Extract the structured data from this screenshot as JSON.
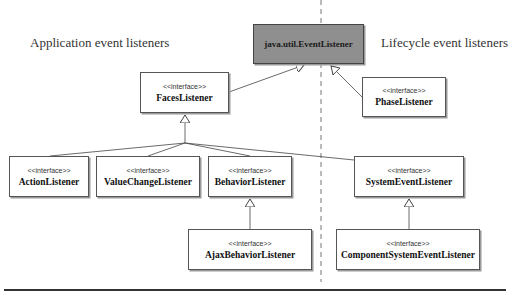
{
  "regions": {
    "left_label": "Application event listeners",
    "right_label": "Lifecycle event listeners"
  },
  "nodes": {
    "event_listener": {
      "name": "java.util.EventListener",
      "stereotype": ""
    },
    "faces_listener": {
      "name": "FacesListener",
      "stereotype": "<<interface>>"
    },
    "phase_listener": {
      "name": "PhaseListener",
      "stereotype": "<<interface>>"
    },
    "action_listener": {
      "name": "ActionListener",
      "stereotype": "<<interface>>"
    },
    "value_change_listener": {
      "name": "ValueChangeListener",
      "stereotype": "<<interface>>"
    },
    "behavior_listener": {
      "name": "BehaviorListener",
      "stereotype": "<<interface>>"
    },
    "system_event_listener": {
      "name": "SystemEventListener",
      "stereotype": "<<interface>>"
    },
    "ajax_behavior_listener": {
      "name": "AjaxBehaviorListener",
      "stereotype": "<<interface>>"
    },
    "component_system_event_listener": {
      "name": "ComponentSystemEventListener",
      "stereotype": "<<interface>>"
    }
  },
  "relations": [
    {
      "from": "FacesListener",
      "to": "java.util.EventListener",
      "type": "generalization"
    },
    {
      "from": "PhaseListener",
      "to": "java.util.EventListener",
      "type": "generalization"
    },
    {
      "from": "ActionListener",
      "to": "FacesListener",
      "type": "generalization"
    },
    {
      "from": "ValueChangeListener",
      "to": "FacesListener",
      "type": "generalization"
    },
    {
      "from": "BehaviorListener",
      "to": "FacesListener",
      "type": "generalization"
    },
    {
      "from": "SystemEventListener",
      "to": "FacesListener",
      "type": "generalization"
    },
    {
      "from": "AjaxBehaviorListener",
      "to": "BehaviorListener",
      "type": "generalization"
    },
    {
      "from": "ComponentSystemEventListener",
      "to": "SystemEventListener",
      "type": "generalization"
    }
  ],
  "colors": {
    "root_fill": "#8f8f8f",
    "box_border": "#555555",
    "line": "#444444"
  }
}
